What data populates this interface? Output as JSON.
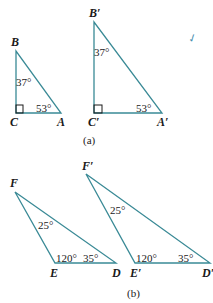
{
  "figure_a": {
    "caption": "(a)",
    "triangle_1": {
      "vertices": {
        "B": "B",
        "C": "C",
        "A": "A"
      },
      "angles": {
        "B": "37°",
        "A": "53°",
        "C": "right-angle"
      }
    },
    "triangle_2": {
      "vertices": {
        "B": "B′",
        "C": "C′",
        "A": "A′"
      },
      "angles": {
        "B": "37°",
        "A": "53°",
        "C": "right-angle"
      }
    }
  },
  "figure_b": {
    "caption": "(b)",
    "triangle_1": {
      "vertices": {
        "F": "F",
        "E": "E",
        "D": "D"
      },
      "angles": {
        "F": "25°",
        "E": "120°",
        "D": "35°"
      }
    },
    "triangle_2": {
      "vertices": {
        "F": "F′",
        "E": "E′",
        "D": "D′"
      },
      "angles": {
        "F": "25°",
        "E": "120°",
        "D": "35°"
      }
    }
  },
  "annotation": {
    "text": "✓"
  },
  "colors": {
    "line": "#3a8a96",
    "text": "#1a1a1a",
    "annotation": "#4a8fb0"
  }
}
